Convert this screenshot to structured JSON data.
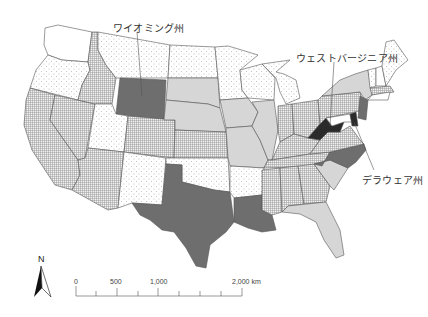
{
  "map": {
    "subject": "United States (contiguous) states classified by fill pattern",
    "labels": [
      {
        "id": "wyoming",
        "text": "ワイオミング州"
      },
      {
        "id": "west_virginia",
        "text": "ウェストバージニア州"
      },
      {
        "id": "delaware",
        "text": "デラウェア州"
      }
    ],
    "legend_classes": {
      "black": "#2a2a2a",
      "dark_gray": "#6e6e6e",
      "light_gray": "#d6d6d6",
      "crosshatch": "grid pattern",
      "dotted": "dot pattern",
      "white": "#ffffff"
    },
    "north_arrow": {
      "label": "N"
    },
    "scale_bar": {
      "ticks": [
        "0",
        "500",
        "1,000",
        "2,000 km"
      ]
    }
  }
}
